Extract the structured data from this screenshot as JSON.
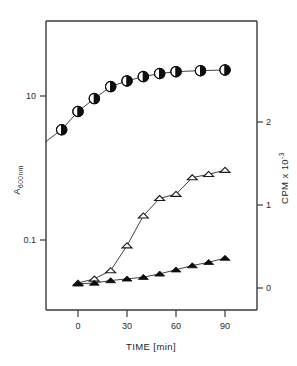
{
  "chart_data": {
    "type": "line",
    "title": "",
    "xlabel": "TIME  [min]",
    "ylabel_left": "A 600nm",
    "ylabel_right": "CPM x 10 -3",
    "ylabel_left_main": "A",
    "ylabel_left_sub": "600nm",
    "ylabel_right_main": "CPM x 10",
    "ylabel_right_sup": "-3",
    "grid": false,
    "legend": "none",
    "x": [
      0,
      10,
      20,
      30,
      40,
      50,
      60,
      70,
      80,
      90
    ],
    "xlim": [
      -20,
      95
    ],
    "xticks": [
      0,
      30,
      60,
      90
    ],
    "xticklabels": [
      "0",
      "30",
      "60",
      "90"
    ],
    "left_axis": {
      "scale": "log",
      "ticks": [
        10,
        0.1
      ],
      "ticklabels": [
        "10",
        "0.1"
      ],
      "ylim": [
        0.028,
        38
      ]
    },
    "right_axis": {
      "scale": "linear",
      "ticks": [
        0,
        1,
        2
      ],
      "ticklabels": [
        "0",
        "1",
        "2"
      ],
      "ylim": [
        -0.28,
        3.48
      ]
    },
    "series": [
      {
        "name": "Growth (A600nm)",
        "marker": "half-filled-circle",
        "axis": "left",
        "x": [
          -10,
          0,
          10,
          20,
          30,
          40,
          50,
          60,
          75,
          90
        ],
        "values": [
          3.4,
          6.1,
          9.2,
          13.5,
          16.2,
          18.6,
          20.5,
          21.8,
          22.5,
          23.0
        ]
      },
      {
        "name": "Induced CPM (open triangle)",
        "marker": "open-triangle",
        "axis": "right",
        "x": [
          0,
          10,
          20,
          30,
          40,
          50,
          60,
          70,
          80,
          90
        ],
        "values": [
          0.06,
          0.11,
          0.21,
          0.51,
          0.87,
          1.08,
          1.13,
          1.33,
          1.37,
          1.42
        ]
      },
      {
        "name": "Control CPM (filled triangle)",
        "marker": "filled-triangle",
        "axis": "right",
        "x": [
          0,
          10,
          20,
          30,
          40,
          50,
          60,
          70,
          80,
          90
        ],
        "values": [
          0.05,
          0.06,
          0.09,
          0.11,
          0.13,
          0.17,
          0.22,
          0.27,
          0.31,
          0.36
        ]
      }
    ]
  },
  "figure": {
    "caption": "",
    "plot_area": {
      "left_px": 46,
      "right_px": 257,
      "top_px": 21,
      "bottom_px": 310
    }
  },
  "colors": {
    "background": "#ffffff",
    "axis": "#3a3a3a",
    "series_line": "#2a2a2a",
    "marker_fill": "#0d0d0d",
    "marker_open": "#ffffff"
  }
}
